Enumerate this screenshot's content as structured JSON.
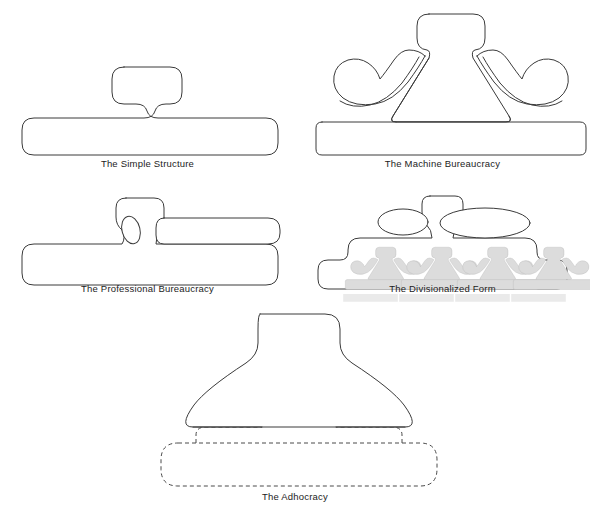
{
  "diagram": {
    "background_color": "#ffffff",
    "line_color": "#3a3a3a",
    "mini_glyph_fill": "#dcdcdc",
    "mini_glyph_stroke": "#a8a8a8",
    "caption_color": "#1c1c1c"
  },
  "figures": [
    {
      "id": "simple-structure",
      "label": "The Simple Structure",
      "outline_style": "solid",
      "parts": [
        "strategic-apex",
        "operating-core"
      ],
      "mini_units": 0
    },
    {
      "id": "machine-bureaucracy",
      "label": "The Machine Bureaucracy",
      "outline_style": "solid",
      "parts": [
        "strategic-apex",
        "middle-line",
        "technostructure-wing",
        "support-staff-wing",
        "operating-core"
      ],
      "mini_units": 0
    },
    {
      "id": "professional-bureaucracy",
      "label": "The Professional Bureaucracy",
      "outline_style": "solid",
      "parts": [
        "strategic-apex",
        "middle-line",
        "technostructure-ellipse",
        "support-staff-lozenge",
        "operating-core"
      ],
      "mini_units": 0
    },
    {
      "id": "divisionalized-form",
      "label": "The Divisionalized Form",
      "outline_style": "solid",
      "parts": [
        "strategic-apex",
        "technostructure-ellipse",
        "support-staff-ellipse",
        "divisions-base"
      ],
      "mini_units": 4
    },
    {
      "id": "adhocracy",
      "label": "The Adhocracy",
      "outline_style": "solid-with-dashed-core",
      "parts": [
        "fused-administrative-body",
        "dashed-operating-core"
      ],
      "mini_units": 0
    }
  ]
}
